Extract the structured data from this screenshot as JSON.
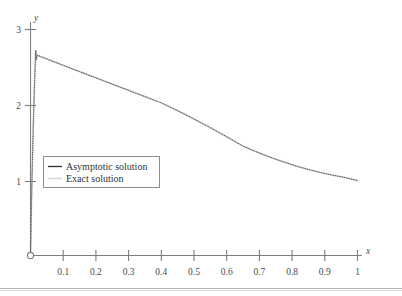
{
  "chart_data": {
    "type": "line",
    "title": "",
    "xlabel": "x",
    "ylabel": "y",
    "xlim": [
      0,
      1
    ],
    "ylim": [
      0,
      3
    ],
    "grid": false,
    "legend_position": "center-left",
    "x_ticks": [
      0.1,
      0.2,
      0.3,
      0.4,
      0.5,
      0.6,
      0.7,
      0.8,
      0.9,
      1
    ],
    "x_tick_labels": [
      "0.1",
      "0.2",
      "0.3",
      "0.4",
      "0.5",
      "0.6",
      "0.7",
      "0.8",
      "0.9",
      "1"
    ],
    "y_ticks": [
      1,
      2,
      3
    ],
    "y_tick_labels": [
      "1",
      "2",
      "3"
    ],
    "origin_marker": "open-circle",
    "annotations": [],
    "series": [
      {
        "name": "Asymptotic solution",
        "style": "dotted-dark",
        "x": [
          0.0,
          0.002,
          0.004,
          0.006,
          0.008,
          0.01,
          0.012,
          0.014,
          0.016,
          0.018,
          0.02,
          0.025,
          0.03,
          0.04,
          0.05,
          0.06,
          0.07,
          0.08,
          0.09,
          0.1,
          0.125,
          0.15,
          0.175,
          0.2,
          0.225,
          0.25,
          0.275,
          0.3,
          0.325,
          0.35,
          0.375,
          0.4,
          0.425,
          0.45,
          0.475,
          0.5,
          0.525,
          0.55,
          0.575,
          0.6,
          0.625,
          0.65,
          0.675,
          0.7,
          0.725,
          0.75,
          0.775,
          0.8,
          0.825,
          0.85,
          0.875,
          0.9,
          0.925,
          0.95,
          0.975,
          1.0
        ],
        "y": [
          0.0,
          0.474,
          0.902,
          1.288,
          1.637,
          1.952,
          2.236,
          2.492,
          2.723,
          2.599,
          2.66,
          2.652,
          2.643,
          2.626,
          2.609,
          2.592,
          2.575,
          2.558,
          2.541,
          2.524,
          2.482,
          2.441,
          2.399,
          2.358,
          2.316,
          2.275,
          2.233,
          2.192,
          2.15,
          2.109,
          2.067,
          2.026,
          1.975,
          1.922,
          1.868,
          1.812,
          1.755,
          1.697,
          1.637,
          1.576,
          1.514,
          1.452,
          1.405,
          1.36,
          1.318,
          1.278,
          1.24,
          1.205,
          1.172,
          1.142,
          1.114,
          1.089,
          1.066,
          1.045,
          1.021,
          0.995
        ]
      },
      {
        "name": "Exact solution",
        "style": "solid-light",
        "x": [
          0.0,
          0.002,
          0.004,
          0.006,
          0.008,
          0.01,
          0.012,
          0.014,
          0.016,
          0.018,
          0.02,
          0.025,
          0.03,
          0.04,
          0.05,
          0.06,
          0.07,
          0.08,
          0.09,
          0.1,
          0.125,
          0.15,
          0.175,
          0.2,
          0.225,
          0.25,
          0.275,
          0.3,
          0.325,
          0.35,
          0.375,
          0.4,
          0.425,
          0.45,
          0.475,
          0.5,
          0.525,
          0.55,
          0.575,
          0.6,
          0.625,
          0.65,
          0.675,
          0.7,
          0.725,
          0.75,
          0.775,
          0.8,
          0.825,
          0.85,
          0.875,
          0.9,
          0.925,
          0.95,
          0.975,
          1.0
        ],
        "y": [
          0.0,
          0.474,
          0.902,
          1.288,
          1.637,
          1.952,
          2.236,
          2.492,
          2.723,
          2.599,
          2.66,
          2.652,
          2.643,
          2.626,
          2.609,
          2.592,
          2.575,
          2.558,
          2.541,
          2.524,
          2.482,
          2.441,
          2.399,
          2.358,
          2.316,
          2.275,
          2.233,
          2.192,
          2.15,
          2.109,
          2.067,
          2.026,
          1.975,
          1.922,
          1.868,
          1.812,
          1.755,
          1.697,
          1.637,
          1.576,
          1.514,
          1.452,
          1.405,
          1.36,
          1.318,
          1.278,
          1.24,
          1.205,
          1.172,
          1.142,
          1.114,
          1.089,
          1.066,
          1.045,
          1.021,
          0.995
        ]
      }
    ]
  },
  "legend": {
    "items": [
      {
        "label": "Asymptotic solution"
      },
      {
        "label": "Exact solution"
      }
    ]
  },
  "axes": {
    "x_name": "x",
    "y_name": "y"
  }
}
